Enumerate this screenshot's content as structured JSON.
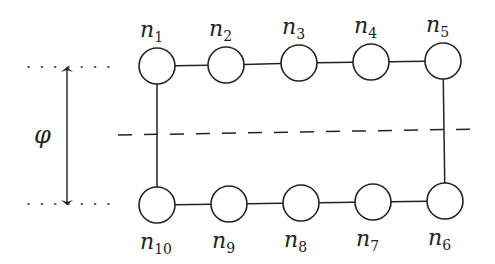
{
  "diagram": {
    "type": "ring-of-nodes",
    "colors": {
      "stroke": "#222222",
      "background": "#ffffff"
    },
    "angle_label": "φ",
    "nodes": [
      {
        "id": "n1",
        "base": "n",
        "sub": "1",
        "cx": 157,
        "cy": 66,
        "label_pos": "above"
      },
      {
        "id": "n2",
        "base": "n",
        "sub": "2",
        "cx": 226,
        "cy": 65,
        "label_pos": "above"
      },
      {
        "id": "n3",
        "base": "n",
        "sub": "3",
        "cx": 299,
        "cy": 63,
        "label_pos": "above"
      },
      {
        "id": "n4",
        "base": "n",
        "sub": "4",
        "cx": 371,
        "cy": 62,
        "label_pos": "above"
      },
      {
        "id": "n5",
        "base": "n",
        "sub": "5",
        "cx": 443,
        "cy": 61,
        "label_pos": "above"
      },
      {
        "id": "n6",
        "base": "n",
        "sub": "6",
        "cx": 445,
        "cy": 201,
        "label_pos": "below"
      },
      {
        "id": "n7",
        "base": "n",
        "sub": "7",
        "cx": 373,
        "cy": 202,
        "label_pos": "below"
      },
      {
        "id": "n8",
        "base": "n",
        "sub": "8",
        "cx": 301,
        "cy": 203,
        "label_pos": "below"
      },
      {
        "id": "n9",
        "base": "n",
        "sub": "9",
        "cx": 229,
        "cy": 204,
        "label_pos": "below"
      },
      {
        "id": "n10",
        "base": "n",
        "sub": "10",
        "cx": 157,
        "cy": 205,
        "label_pos": "below"
      }
    ],
    "edges": [
      [
        "n1",
        "n2"
      ],
      [
        "n2",
        "n3"
      ],
      [
        "n3",
        "n4"
      ],
      [
        "n4",
        "n5"
      ],
      [
        "n5",
        "n6"
      ],
      [
        "n6",
        "n7"
      ],
      [
        "n7",
        "n8"
      ],
      [
        "n8",
        "n9"
      ],
      [
        "n9",
        "n10"
      ],
      [
        "n10",
        "n1"
      ]
    ],
    "dashed_line": {
      "x1": 118,
      "y1": 135,
      "x2": 480,
      "y2": 129
    },
    "arrow": {
      "x": 67,
      "y1": 67,
      "y2": 205
    },
    "dotted_guides": [
      {
        "x1": 28,
        "x2": 112,
        "y": 67
      },
      {
        "x1": 28,
        "x2": 112,
        "y": 204
      }
    ]
  }
}
